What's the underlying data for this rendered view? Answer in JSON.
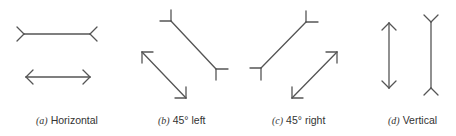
{
  "panels": [
    {
      "label": "(a)",
      "caption": "Horizontal"
    },
    {
      "label": "(b)",
      "caption": "45° left"
    },
    {
      "label": "(c)",
      "caption": "45° right"
    },
    {
      "label": "(d)",
      "caption": "Vertical"
    }
  ],
  "stroke_color": "#555555"
}
